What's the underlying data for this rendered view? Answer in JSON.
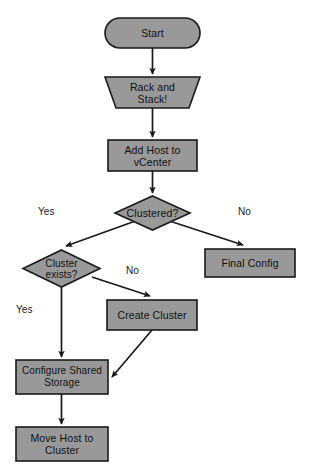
{
  "diagram": {
    "colors": {
      "node_fill": "#999999",
      "node_stroke": "#1a1a1a",
      "edge_stroke": "#1a1a1a",
      "text": "#111111",
      "background": "#ffffff"
    },
    "nodes": [
      {
        "id": "start",
        "shape": "stadium",
        "label": "Start"
      },
      {
        "id": "rack_and_stack",
        "shape": "trapezoid",
        "label": "Rack and\nStack!"
      },
      {
        "id": "add_host",
        "shape": "rectangle",
        "label": "Add Host to\nvCenter"
      },
      {
        "id": "clustered",
        "shape": "diamond",
        "label": "Clustered?"
      },
      {
        "id": "cluster_exists",
        "shape": "diamond",
        "label": "Cluster\nexists?"
      },
      {
        "id": "final_config",
        "shape": "rectangle",
        "label": "Final Config"
      },
      {
        "id": "create_cluster",
        "shape": "rectangle",
        "label": "Create Cluster"
      },
      {
        "id": "configure_storage",
        "shape": "rectangle",
        "label": "Configure Shared\nStorage"
      },
      {
        "id": "move_host",
        "shape": "rectangle",
        "label": "Move Host to\nCluster"
      }
    ],
    "edges": [
      {
        "id": "e-start-rack",
        "from": "start",
        "to": "rack_and_stack",
        "label": ""
      },
      {
        "id": "e-rack-addhost",
        "from": "rack_and_stack",
        "to": "add_host",
        "label": ""
      },
      {
        "id": "e-addhost-clustered",
        "from": "add_host",
        "to": "clustered",
        "label": ""
      },
      {
        "id": "e-clustered-yes",
        "from": "clustered",
        "to": "cluster_exists",
        "label": "Yes"
      },
      {
        "id": "e-clustered-no",
        "from": "clustered",
        "to": "final_config",
        "label": "No"
      },
      {
        "id": "e-exists-yes",
        "from": "cluster_exists",
        "to": "configure_storage",
        "label": "Yes"
      },
      {
        "id": "e-exists-no",
        "from": "cluster_exists",
        "to": "create_cluster",
        "label": "No"
      },
      {
        "id": "e-create-configure",
        "from": "create_cluster",
        "to": "configure_storage",
        "label": ""
      },
      {
        "id": "e-configure-movehost",
        "from": "configure_storage",
        "to": "move_host",
        "label": ""
      }
    ],
    "edge_labels": {
      "clustered_yes": "Yes",
      "clustered_no": "No",
      "exists_yes": "Yes",
      "exists_no": "No"
    }
  }
}
